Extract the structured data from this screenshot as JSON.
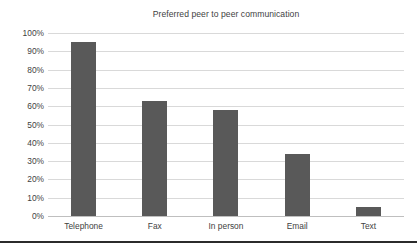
{
  "chart_data": {
    "type": "bar",
    "title": "Preferred peer to peer communication",
    "xlabel": "",
    "ylabel": "",
    "categories": [
      "Telephone",
      "Fax",
      "In person",
      "Email",
      "Text"
    ],
    "values": [
      95,
      63,
      58,
      34,
      5
    ],
    "ylim": [
      0,
      100
    ],
    "ytick_labels": [
      "100%",
      "90%",
      "80%",
      "70%",
      "60%",
      "50%",
      "40%",
      "30%",
      "20%",
      "10%",
      "0%"
    ],
    "ytick_values": [
      100,
      90,
      80,
      70,
      60,
      50,
      40,
      30,
      20,
      10,
      0
    ],
    "grid": true,
    "legend": false,
    "series": [
      {
        "name": "Preferred peer to peer communication",
        "values": [
          95,
          63,
          58,
          34,
          5
        ]
      }
    ],
    "colors": {
      "bar": "#595959",
      "gridline": "#d9d9d9",
      "axis": "#bfbfbf",
      "text": "#3f3f3f",
      "background": "#ffffff",
      "bottom_rule": "#2b2b2b"
    }
  }
}
